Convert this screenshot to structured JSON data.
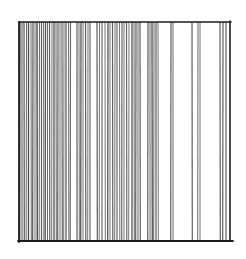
{
  "artwork": {
    "title": "Vertical line drawing",
    "medium": "pen and ink",
    "background_color": "#ffffff",
    "ink_color": "#2a2a2a",
    "frame": {
      "left": 19,
      "top": 22,
      "right": 230,
      "bottom": 241
    },
    "vertical_lines": [
      {
        "x": 20,
        "w": 1.3,
        "o": 0.85
      },
      {
        "x": 22,
        "w": 1.1,
        "o": 0.75
      },
      {
        "x": 24,
        "w": 1.2,
        "o": 0.8
      },
      {
        "x": 26.5,
        "w": 1.0,
        "o": 0.7
      },
      {
        "x": 28.5,
        "w": 1.3,
        "o": 0.85
      },
      {
        "x": 31,
        "w": 1.0,
        "o": 0.7
      },
      {
        "x": 33,
        "w": 1.2,
        "o": 0.8
      },
      {
        "x": 35,
        "w": 1.0,
        "o": 0.65
      },
      {
        "x": 37,
        "w": 1.4,
        "o": 0.85
      },
      {
        "x": 39.5,
        "w": 1.0,
        "o": 0.7
      },
      {
        "x": 41.5,
        "w": 1.2,
        "o": 0.75
      },
      {
        "x": 43.5,
        "w": 1.0,
        "o": 0.65
      },
      {
        "x": 45.5,
        "w": 1.3,
        "o": 0.8
      },
      {
        "x": 47.5,
        "w": 1.0,
        "o": 0.7
      },
      {
        "x": 49.5,
        "w": 1.2,
        "o": 0.75
      },
      {
        "x": 52,
        "w": 1.0,
        "o": 0.65
      },
      {
        "x": 54,
        "w": 1.3,
        "o": 0.8
      },
      {
        "x": 56,
        "w": 1.0,
        "o": 0.7
      },
      {
        "x": 58,
        "w": 1.2,
        "o": 0.75
      },
      {
        "x": 60,
        "w": 1.0,
        "o": 0.65
      },
      {
        "x": 62,
        "w": 1.2,
        "o": 0.7
      },
      {
        "x": 64,
        "w": 1.0,
        "o": 0.65
      },
      {
        "x": 66,
        "w": 1.3,
        "o": 0.75
      },
      {
        "x": 68.5,
        "w": 1.0,
        "o": 0.65
      },
      {
        "x": 70.5,
        "w": 1.2,
        "o": 0.7
      },
      {
        "x": 77,
        "w": 1.2,
        "o": 0.75
      },
      {
        "x": 79,
        "w": 1.0,
        "o": 0.65
      },
      {
        "x": 81,
        "w": 1.3,
        "o": 0.8
      },
      {
        "x": 83,
        "w": 1.0,
        "o": 0.65
      },
      {
        "x": 85.5,
        "w": 1.2,
        "o": 0.75
      },
      {
        "x": 88,
        "w": 1.0,
        "o": 0.65
      },
      {
        "x": 90,
        "w": 1.2,
        "o": 0.7
      },
      {
        "x": 97,
        "w": 1.2,
        "o": 0.75
      },
      {
        "x": 99.5,
        "w": 1.0,
        "o": 0.65
      },
      {
        "x": 102,
        "w": 1.2,
        "o": 0.7
      },
      {
        "x": 105,
        "w": 1.0,
        "o": 0.65
      },
      {
        "x": 108,
        "w": 1.3,
        "o": 0.8
      },
      {
        "x": 110,
        "w": 1.0,
        "o": 0.65
      },
      {
        "x": 112.5,
        "w": 1.2,
        "o": 0.75
      },
      {
        "x": 115,
        "w": 1.0,
        "o": 0.65
      },
      {
        "x": 117,
        "w": 1.2,
        "o": 0.7
      },
      {
        "x": 119.5,
        "w": 1.0,
        "o": 0.65
      },
      {
        "x": 122,
        "w": 1.2,
        "o": 0.7
      },
      {
        "x": 124,
        "w": 1.0,
        "o": 0.65
      },
      {
        "x": 126.5,
        "w": 1.2,
        "o": 0.7
      },
      {
        "x": 129,
        "w": 1.0,
        "o": 0.65
      },
      {
        "x": 132,
        "w": 1.3,
        "o": 0.8
      },
      {
        "x": 134,
        "w": 1.0,
        "o": 0.7
      },
      {
        "x": 136,
        "w": 1.2,
        "o": 0.75
      },
      {
        "x": 138,
        "w": 1.0,
        "o": 0.7
      },
      {
        "x": 140,
        "w": 1.2,
        "o": 0.75
      },
      {
        "x": 148,
        "w": 1.2,
        "o": 0.75
      },
      {
        "x": 150,
        "w": 1.0,
        "o": 0.7
      },
      {
        "x": 152,
        "w": 1.3,
        "o": 0.8
      },
      {
        "x": 154,
        "w": 1.0,
        "o": 0.7
      },
      {
        "x": 156,
        "w": 1.2,
        "o": 0.75
      },
      {
        "x": 158,
        "w": 1.0,
        "o": 0.65
      },
      {
        "x": 171,
        "w": 1.2,
        "o": 0.75
      },
      {
        "x": 173,
        "w": 1.0,
        "o": 0.7
      },
      {
        "x": 192,
        "w": 1.2,
        "o": 0.75
      },
      {
        "x": 198,
        "w": 1.0,
        "o": 0.7
      },
      {
        "x": 200,
        "w": 1.0,
        "o": 0.65
      },
      {
        "x": 220,
        "w": 1.2,
        "o": 0.75
      },
      {
        "x": 223,
        "w": 1.2,
        "o": 0.75
      },
      {
        "x": 226,
        "w": 1.2,
        "o": 0.75
      }
    ]
  }
}
